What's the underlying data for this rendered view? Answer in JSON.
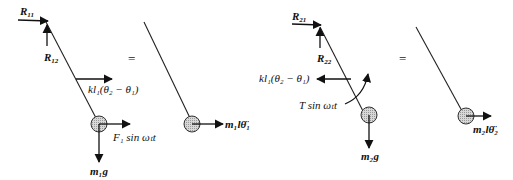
{
  "diagram": {
    "panel1_fbd": {
      "labels": {
        "r11": "R",
        "r11_sub": "11",
        "r12": "R",
        "r12_sub": "12",
        "spring_force": "kl₁(θ₂ − θ₁)",
        "excitation": "F₁ sin ωₜt",
        "weight": "m₁g"
      }
    },
    "panel1_equals": "=",
    "panel1_kinetic": {
      "inertia_label": "m₁lθ̈₁"
    },
    "panel2_fbd": {
      "labels": {
        "r21": "R",
        "r21_sub": "21",
        "r22": "R",
        "r22_sub": "22",
        "spring_force": "kl₁(θ₂ − θ₁)",
        "torque": "T sin ωₜt",
        "weight": "m₂g"
      }
    },
    "panel2_equals": "=",
    "panel2_kinetic": {
      "inertia_label": "m₂lθ̈₂"
    }
  }
}
